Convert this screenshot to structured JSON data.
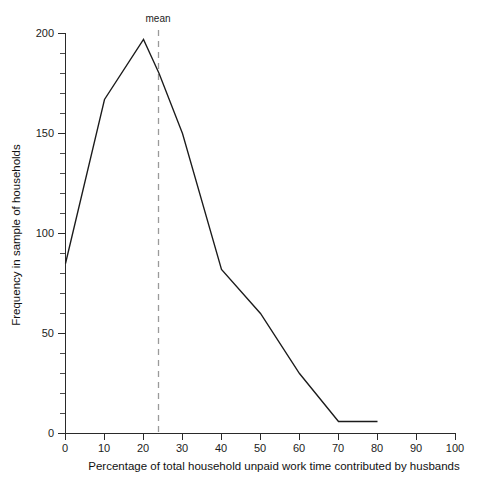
{
  "chart_data": {
    "type": "line",
    "title": "",
    "subtitle": "",
    "xlabel": "Percentage of total household unpaid work time contributed by husbands",
    "ylabel": "Frequency in sample of households",
    "xlim": [
      0,
      100
    ],
    "ylim": [
      0,
      200
    ],
    "grid": false,
    "legend": false,
    "x": [
      0,
      10,
      20,
      24,
      30,
      40,
      50,
      60,
      70,
      80
    ],
    "values": [
      85,
      167,
      197,
      180,
      150,
      82,
      60,
      30,
      6,
      6
    ],
    "series": [
      {
        "name": "Frequency in sample of households",
        "x": [
          0,
          10,
          20,
          24,
          30,
          40,
          50,
          60,
          70,
          80
        ],
        "values": [
          85,
          167,
          197,
          180,
          150,
          82,
          60,
          30,
          6,
          6
        ],
        "color": "#1b1b1b"
      }
    ],
    "x_ticks": [
      0,
      10,
      20,
      30,
      40,
      50,
      60,
      70,
      80,
      90,
      100
    ],
    "x_tick_labels": [
      "0",
      "10",
      "20",
      "30",
      "40",
      "50",
      "60",
      "70",
      "80",
      "90",
      "100"
    ],
    "y_ticks": [
      0,
      50,
      100,
      150,
      200
    ],
    "y_tick_labels": [
      "0",
      "50",
      "100",
      "150",
      "200"
    ],
    "y_minor_step": 10,
    "annotations": [
      {
        "name": "mean",
        "label": "mean",
        "x": 24,
        "style": "dashed-vertical-line",
        "color": "#9a9a9a"
      }
    ]
  },
  "figure": {
    "background": "#ffffff",
    "line_color": "#1b1b1b",
    "axis_color": "#2a2a2a",
    "text_color": "#1c1c1c"
  }
}
